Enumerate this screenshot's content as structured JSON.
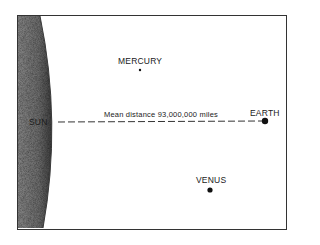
{
  "diagram": {
    "title": "",
    "labels": {
      "sun": "SUN",
      "mercury": "MERCURY",
      "venus": "VENUS",
      "earth": "EARTH",
      "distance": "Mean distance 93,000,000 miles"
    },
    "bodies": [
      {
        "name": "Sun",
        "label": "SUN",
        "shape": "large shaded arc at left edge"
      },
      {
        "name": "Mercury",
        "label": "MERCURY",
        "x": 140,
        "y": 70,
        "dot": "small"
      },
      {
        "name": "Earth",
        "label": "EARTH",
        "x": 265,
        "y": 120,
        "dot": "large"
      },
      {
        "name": "Venus",
        "label": "VENUS",
        "x": 210,
        "y": 189,
        "dot": "medium"
      }
    ],
    "connector": {
      "from": "SUN",
      "to": "EARTH",
      "style": "dashed",
      "label": "Mean distance 93,000,000 miles"
    },
    "colors": {
      "sun_fill": "#6e6e6e",
      "sun_edge": "#3a3a3a",
      "frame": "#333333",
      "dots": "#111111",
      "text": "#1a1a1a"
    }
  }
}
